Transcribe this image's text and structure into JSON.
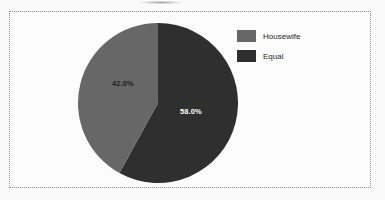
{
  "chart_data": {
    "type": "pie",
    "title": "",
    "xlabel": "",
    "ylabel": "",
    "categories": [
      "Housewife",
      "Equal"
    ],
    "values": [
      42.0,
      58.0
    ],
    "data_labels": [
      "42.0%",
      "58.0%"
    ],
    "colors": [
      "#676767",
      "#2f2f2f"
    ],
    "label_text_colors": [
      "#1d1d1d",
      "#ffffff"
    ],
    "start_angle_deg": 0,
    "direction": "clockwise",
    "first_slice_drawn": "Equal",
    "grid": false,
    "legend": {
      "position": "right",
      "entries": [
        {
          "label": "Housewife",
          "color": "#676767"
        },
        {
          "label": "Equal",
          "color": "#2f2f2f"
        }
      ]
    }
  },
  "frame": {
    "border_color": "#8d8d8d",
    "border_style": "dotted",
    "background": "#fcfcfc"
  },
  "page": {
    "background": "#fafafa"
  }
}
